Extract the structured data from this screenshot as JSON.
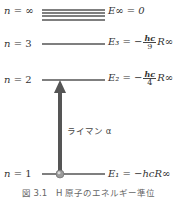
{
  "levels": [
    {
      "n_label": "n",
      "n_value": "∞",
      "energy_label": "E∞ = 0",
      "y": [
        10,
        13,
        16,
        20
      ]
    },
    {
      "n_label": "n",
      "n_value": "3",
      "energy_prefix": "E₃ = −",
      "frac_num": "hc",
      "frac_den": "9",
      "energy_suffix": "R∞",
      "y": 44
    },
    {
      "n_label": "n",
      "n_value": "2",
      "energy_prefix": "E₂ = −",
      "frac_num": "hc",
      "frac_den": "4",
      "energy_suffix": "R∞",
      "y": 80
    },
    {
      "n_label": "n",
      "n_value": "1",
      "energy_label": "E₁ = −hcR∞",
      "y": 174
    }
  ],
  "transition": {
    "label": "ライマン α",
    "from_level": "1",
    "to_level": "2"
  },
  "caption": "図 3.1　H 原子のエネルギー準位",
  "colors": {
    "line": "#555555",
    "arrow": "#555555",
    "ball": "#9a9a9a"
  }
}
